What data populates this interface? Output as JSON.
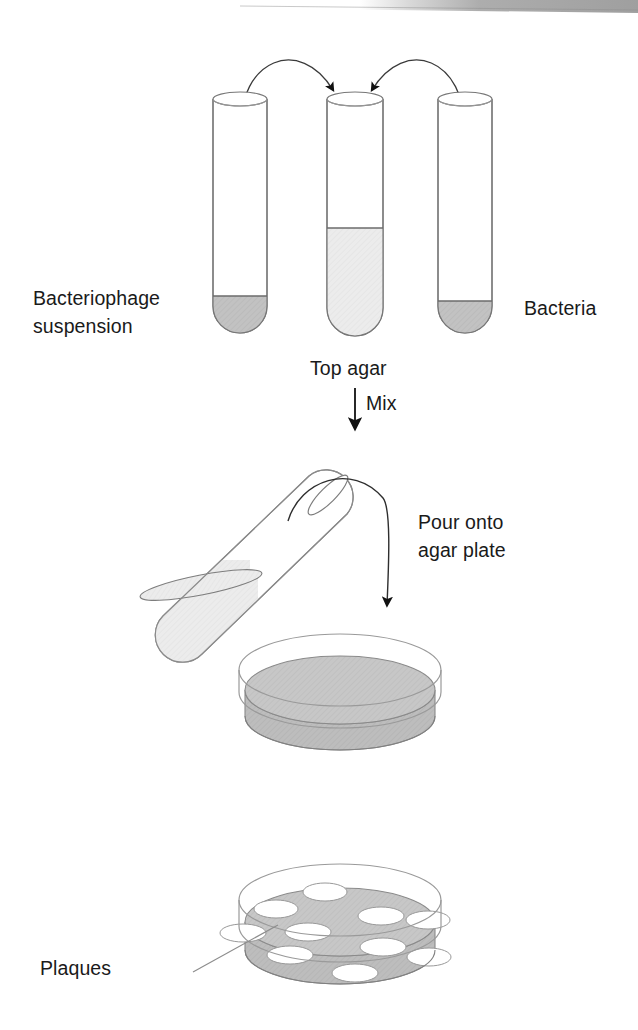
{
  "figure": {
    "title_alt": "Plaque assay procedure diagram",
    "background_color": "#ffffff",
    "line_color": "#6e6e6e",
    "text_color": "#1a1a1a",
    "dark_fill_color": "#c2c2c2",
    "light_fill_color": "#eaeaea",
    "agar_fill_color": "#c6c6c6",
    "plaque_fill_color": "#ffffff",
    "arrow_color": "#111111"
  },
  "labels": {
    "bacteriophage_suspension": "Bacteriophage\nsuspension",
    "bacteriophage_suspension_line1": "Bacteriophage",
    "bacteriophage_suspension_line2": "suspension",
    "bacteria": "Bacteria",
    "top_agar": "Top agar",
    "mix": "Mix",
    "pour_onto_line1": "Pour onto",
    "pour_onto_line2": "agar plate",
    "plaques": "Plaques"
  },
  "stage1": {
    "name": "three-test-tubes",
    "tubes": [
      {
        "id": "tube-phage",
        "label": "Bacteriophage suspension",
        "fill": "dark",
        "fill_level_fraction": 0.17,
        "x": 213,
        "width": 54
      },
      {
        "id": "tube-top-agar",
        "label": "Top agar",
        "fill": "light",
        "fill_level_fraction": 0.45,
        "x": 327,
        "width": 56
      },
      {
        "id": "tube-bacteria",
        "label": "Bacteria",
        "fill": "dark",
        "fill_level_fraction": 0.15,
        "x": 438,
        "width": 54
      }
    ],
    "transfer_arrows": 2
  },
  "stage2": {
    "name": "pour-tilted-tube",
    "tube_rotation_degrees": -45,
    "action": "Pour onto agar plate"
  },
  "stage3": {
    "name": "agar-plate",
    "description": "Petri dish with uniform agar lawn"
  },
  "stage4": {
    "name": "plate-with-plaques",
    "plaque_count": 10,
    "plaques": [
      {
        "cx": 325,
        "cy": 892,
        "rx": 22,
        "ry": 9
      },
      {
        "cx": 276,
        "cy": 909,
        "rx": 22,
        "ry": 9
      },
      {
        "cx": 381,
        "cy": 916,
        "rx": 23,
        "ry": 9
      },
      {
        "cx": 428,
        "cy": 920,
        "rx": 22,
        "ry": 9
      },
      {
        "cx": 243,
        "cy": 933,
        "rx": 23,
        "ry": 9
      },
      {
        "cx": 308,
        "cy": 932,
        "rx": 23,
        "ry": 9
      },
      {
        "cx": 383,
        "cy": 947,
        "rx": 23,
        "ry": 9
      },
      {
        "cx": 429,
        "cy": 957,
        "rx": 22,
        "ry": 9
      },
      {
        "cx": 290,
        "cy": 955,
        "rx": 23,
        "ry": 9
      },
      {
        "cx": 355,
        "cy": 973,
        "rx": 23,
        "ry": 9
      }
    ],
    "leader_line": {
      "from_x": 270,
      "from_y": 926,
      "to_x": 193,
      "to_y": 972
    }
  }
}
